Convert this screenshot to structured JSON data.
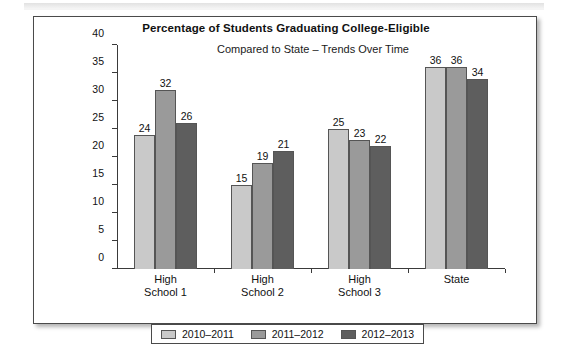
{
  "figure": {
    "title": "Percentage of Students Graduating College-Eligible",
    "subtitle": "Compared to State – Trends Over Time"
  },
  "chart_data": {
    "type": "bar",
    "title": "Percentage of Students Graduating College-Eligible",
    "subtitle": "Compared to State – Trends Over Time",
    "xlabel": "",
    "ylabel": "",
    "ylim": [
      0,
      40
    ],
    "ytick_step": 5,
    "yticks": [
      0,
      5,
      10,
      15,
      20,
      25,
      30,
      35,
      40
    ],
    "grid": false,
    "legend_position": "bottom",
    "categories": [
      "High School 1",
      "High School 2",
      "High School 3",
      "State"
    ],
    "category_lines": [
      [
        "High",
        "School 1"
      ],
      [
        "High",
        "School 2"
      ],
      [
        "High",
        "School 3"
      ],
      [
        "State",
        ""
      ]
    ],
    "series": [
      {
        "name": "2010–2011",
        "color": "#c9c9c9",
        "values": [
          24,
          15,
          25,
          36
        ]
      },
      {
        "name": "2011–2012",
        "color": "#9a9a9a",
        "values": [
          32,
          19,
          23,
          36
        ]
      },
      {
        "name": "2012–2013",
        "color": "#5e5e5e",
        "values": [
          26,
          21,
          22,
          34
        ]
      }
    ]
  },
  "legend": {
    "items": [
      {
        "label": "2010–2011",
        "color": "#c9c9c9"
      },
      {
        "label": "2011–2012",
        "color": "#9a9a9a"
      },
      {
        "label": "2012–2013",
        "color": "#5e5e5e"
      }
    ]
  }
}
